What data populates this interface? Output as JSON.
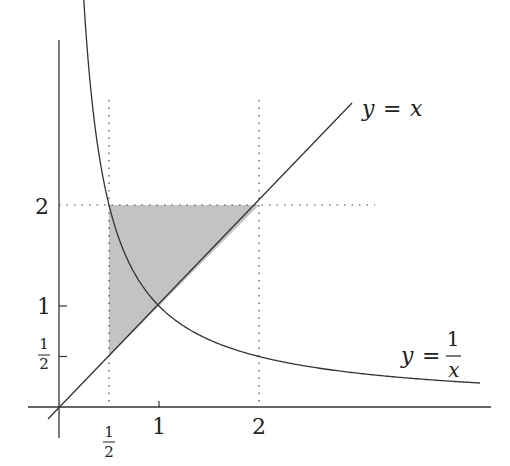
{
  "diagram": {
    "type": "function-plot",
    "curves": [
      {
        "name": "identity-line",
        "equation": "y = x",
        "label_lhs": "y",
        "label_eq": "=",
        "label_rhs": "x"
      },
      {
        "name": "hyperbola",
        "equation": "y = 1/x",
        "label_lhs": "y",
        "label_eq": "=",
        "label_num": "1",
        "label_den": "x"
      }
    ],
    "x_ticks": [
      {
        "value": 0.5,
        "num": "1",
        "den": "2"
      },
      {
        "value": 1,
        "label": "1"
      },
      {
        "value": 2,
        "label": "2"
      }
    ],
    "y_ticks": [
      {
        "value": 0.5,
        "num": "1",
        "den": "2"
      },
      {
        "value": 1,
        "label": "1"
      },
      {
        "value": 2,
        "label": "2"
      }
    ],
    "guides": [
      {
        "type": "vertical",
        "x": 0.5,
        "style": "dotted"
      },
      {
        "type": "vertical",
        "x": 2,
        "style": "dotted"
      },
      {
        "type": "horizontal",
        "y": 2,
        "style": "dotted"
      }
    ],
    "shaded_region": {
      "vertices": [
        [
          0.5,
          0.5
        ],
        [
          0.5,
          2
        ],
        [
          2,
          2
        ]
      ],
      "fill": "#b8b8b8"
    },
    "colors": {
      "axis": "#333333",
      "curve": "#333333",
      "shade": "#b8b8b8"
    }
  }
}
